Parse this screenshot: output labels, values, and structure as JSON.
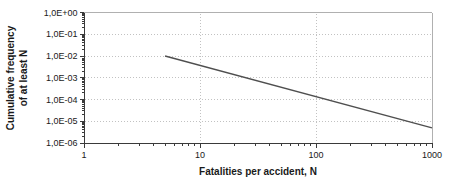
{
  "chart_data": {
    "type": "line",
    "title": "",
    "xlabel": "Fatalities per accident, N",
    "ylabel_line1": "Cumulative frequency",
    "ylabel_line2": "of at least N",
    "xscale": "log",
    "yscale": "log",
    "xlim": [
      1,
      1000
    ],
    "ylim": [
      1e-06,
      1
    ],
    "x_ticks": [
      {
        "label": "1",
        "value": 1
      },
      {
        "label": "10",
        "value": 10
      },
      {
        "label": "100",
        "value": 100
      },
      {
        "label": "1000",
        "value": 1000
      }
    ],
    "y_ticks": [
      {
        "label": "1,0E+00",
        "value": 1
      },
      {
        "label": "1,0E-01",
        "value": 0.1
      },
      {
        "label": "1,0E-02",
        "value": 0.01
      },
      {
        "label": "1,0E-03",
        "value": 0.001
      },
      {
        "label": "1,0E-04",
        "value": 0.0001
      },
      {
        "label": "1,0E-05",
        "value": 1e-05
      },
      {
        "label": "1,0E-06",
        "value": 1e-06
      }
    ],
    "grid": "dotted lines at each decade (horizontal at 1e-1..1e-5, vertical at 10 and 100)",
    "legend": "none",
    "series": [
      {
        "name": "FN curve",
        "points": [
          [
            5,
            0.01
          ],
          [
            1000,
            5e-06
          ]
        ]
      }
    ],
    "colors": {
      "line": "#4f4f4f",
      "grid": "#c2c2c2",
      "axis": "#3a3a3a",
      "frame": "#b0b0b0",
      "text": "#1a1a1a"
    }
  }
}
